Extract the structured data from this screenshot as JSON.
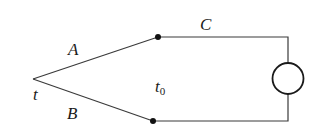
{
  "diagram": {
    "type": "thermocouple-circuit",
    "labels": {
      "wire_a": "A",
      "wire_b": "B",
      "wire_c": "C",
      "hot_junction_temp": "t",
      "reference_temp_base": "t",
      "reference_temp_sub": "0"
    },
    "colors": {
      "line": "#3a3a3a",
      "dot": "#111111",
      "background": "#ffffff"
    },
    "elements": {
      "hot_junction": "vertex where conductors A and B meet",
      "reference_junctions": "two filled dots at temperature t0",
      "instrument": "circle (meter) in series on right side"
    }
  }
}
